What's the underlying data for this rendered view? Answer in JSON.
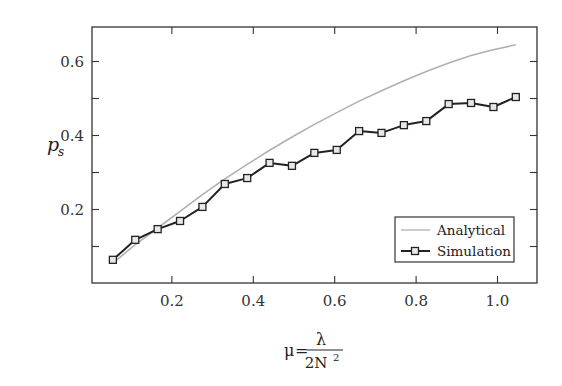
{
  "chart_data": {
    "type": "line",
    "title": "",
    "xlabel": "μ = λ / 2N²",
    "xlabel_parts": {
      "lhs": "μ",
      "eq": "=",
      "numerator": "λ",
      "denominator": "2N",
      "exponent": "2"
    },
    "ylabel": "p_s",
    "ylabel_parts": {
      "base": "p",
      "sub": "s"
    },
    "xlim": [
      0.0,
      1.1
    ],
    "ylim": [
      0.0,
      0.69
    ],
    "xticks": [
      0.2,
      0.4,
      0.6,
      0.8,
      1.0
    ],
    "xtick_labels": [
      "0.2",
      "0.4",
      "0.6",
      "0.8",
      "1.0"
    ],
    "yticks_major": [
      0.2,
      0.4,
      0.6
    ],
    "ytick_labels": [
      "0.2",
      "0.4",
      "0.6"
    ],
    "yticks_minor": [
      0.1,
      0.3,
      0.5
    ],
    "grid": false,
    "legend_position": "lower right",
    "series": [
      {
        "name": "Analytical",
        "style": "line",
        "color": "#b0b0b0",
        "x": [
          0.055,
          0.11,
          0.165,
          0.22,
          0.275,
          0.33,
          0.385,
          0.44,
          0.495,
          0.55,
          0.605,
          0.66,
          0.715,
          0.77,
          0.825,
          0.88,
          0.935,
          0.99,
          1.045
        ],
        "values": [
          0.055,
          0.105,
          0.15,
          0.195,
          0.24,
          0.283,
          0.322,
          0.36,
          0.396,
          0.43,
          0.462,
          0.493,
          0.521,
          0.548,
          0.573,
          0.596,
          0.616,
          0.632,
          0.645
        ]
      },
      {
        "name": "Simulation",
        "style": "line-square-markers",
        "color": "#222222",
        "x": [
          0.055,
          0.11,
          0.165,
          0.22,
          0.275,
          0.33,
          0.385,
          0.44,
          0.495,
          0.55,
          0.605,
          0.66,
          0.715,
          0.77,
          0.825,
          0.88,
          0.935,
          0.99,
          1.045
        ],
        "values": [
          0.064,
          0.118,
          0.147,
          0.169,
          0.207,
          0.269,
          0.285,
          0.326,
          0.318,
          0.353,
          0.361,
          0.412,
          0.407,
          0.428,
          0.439,
          0.485,
          0.488,
          0.477,
          0.504
        ]
      }
    ]
  },
  "legend": {
    "items": [
      {
        "label": "Analytical"
      },
      {
        "label": "Simulation"
      }
    ]
  },
  "colors": {
    "axis": "#333333",
    "analytical": "#b0b0b0",
    "simulation": "#222222",
    "marker_fill": "#e8e8e8"
  }
}
